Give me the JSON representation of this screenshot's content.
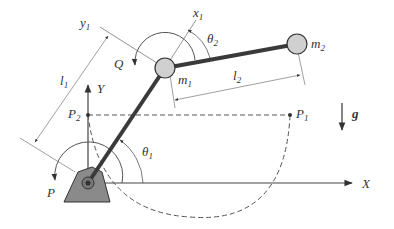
{
  "diagram": {
    "labels": {
      "X": "X",
      "Y": "Y",
      "x1": "x",
      "x1_sub": "1",
      "y1": "y",
      "y1_sub": "1",
      "l1": "l",
      "l1_sub": "1",
      "l2": "l",
      "l2_sub": "2",
      "m1": "m",
      "m1_sub": "1",
      "m2": "m",
      "m2_sub": "2",
      "theta1": "θ",
      "theta1_sub": "1",
      "theta2": "θ",
      "theta2_sub": "2",
      "P": "P",
      "Q": "Q",
      "P1": "P",
      "P1_sub": "1",
      "P2": "P",
      "P2_sub": "2",
      "g": "g"
    },
    "colors": {
      "link": "#3a3a3a",
      "mass_fill": "#d0d0d0",
      "base_fill": "#8a8a8a",
      "line": "#444444",
      "thin": "#666666"
    }
  }
}
